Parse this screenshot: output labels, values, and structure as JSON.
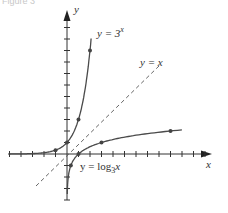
{
  "figure": {
    "caption": "Figure 3",
    "axis_x_label": "x",
    "axis_y_label": "y",
    "exp_label_prefix": "y = 3",
    "exp_label_sup": "x",
    "identity_label": "y = x",
    "log_label_prefix": "y = log",
    "log_label_sub": "3",
    "log_label_suffix": "x",
    "colors": {
      "curve": "#4a4a4a",
      "axis": "#333333",
      "dashed": "#555555",
      "point": "#444444"
    }
  },
  "chart_data": {
    "type": "line",
    "title": "",
    "xlabel": "x",
    "ylabel": "y",
    "xlim": [
      -5,
      12
    ],
    "ylim": [
      -4,
      12
    ],
    "grid": false,
    "series": [
      {
        "name": "y = 3^x",
        "points": [
          [
            -1,
            0.333
          ],
          [
            0,
            1
          ],
          [
            1,
            3
          ],
          [
            2,
            9
          ]
        ]
      },
      {
        "name": "y = log_3 x",
        "points": [
          [
            0.333,
            -1
          ],
          [
            1,
            0
          ],
          [
            3,
            1
          ],
          [
            9,
            2
          ]
        ]
      },
      {
        "name": "y = x",
        "style": "dashed",
        "points": [
          [
            -3,
            -3
          ],
          [
            8,
            8
          ]
        ]
      }
    ]
  }
}
